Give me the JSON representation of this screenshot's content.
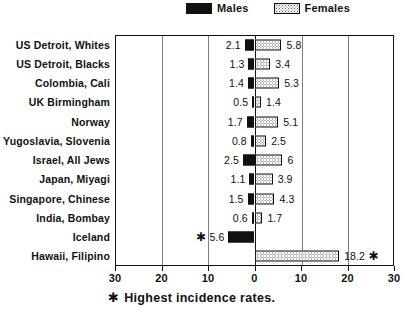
{
  "legend": {
    "males": {
      "label": "Males",
      "icon": "solid-black-swatch",
      "color": "#111111"
    },
    "females": {
      "label": "Females",
      "icon": "stippled-swatch",
      "color": "#ffffff"
    }
  },
  "footnote": {
    "star": "✱",
    "text": "Highest incidence rates."
  },
  "axis": {
    "ticks": [
      "30",
      "20",
      "10",
      "0",
      "10",
      "20",
      "30"
    ],
    "tick_units": [
      -30,
      -20,
      -10,
      0,
      10,
      20,
      30
    ]
  },
  "chart_data": {
    "type": "bar",
    "orientation": "horizontal",
    "layout": "diverging-bidirectional",
    "title": "",
    "subtitle": "",
    "xlabel": "",
    "ylabel": "",
    "xlim": [
      -30,
      30
    ],
    "grid": true,
    "gridlines_at": [
      -20,
      -10,
      10,
      20
    ],
    "legend_position": "top-center",
    "annotation": "✱ Highest incidence rates.",
    "categories": [
      "US Detroit, Whites",
      "US Detroit, Blacks",
      "Colombia, Cali",
      "UK Birmingham",
      "Norway",
      "Yugoslavia, Slovenia",
      "Israel, All Jews",
      "Japan, Miyagi",
      "Singapore, Chinese",
      "India, Bombay",
      "Iceland",
      "Hawaii, Filipino"
    ],
    "series": [
      {
        "name": "Males",
        "direction": "left",
        "color": "#111111",
        "values": [
          2.1,
          1.3,
          1.4,
          0.5,
          1.7,
          0.8,
          2.5,
          1.1,
          1.5,
          0.6,
          5.6,
          null
        ],
        "labels": [
          "2.1",
          "1.3",
          "1.4",
          "0.5",
          "1.7",
          "0.8",
          "2.5",
          "1.1",
          "1.5",
          "0.6",
          "5.6",
          ""
        ],
        "starred": [
          false,
          false,
          false,
          false,
          false,
          false,
          false,
          false,
          false,
          false,
          true,
          false
        ]
      },
      {
        "name": "Females",
        "direction": "right",
        "color": "#ffffff",
        "values": [
          5.8,
          3.4,
          5.3,
          1.4,
          5.1,
          2.5,
          6,
          3.9,
          4.3,
          1.7,
          null,
          18.2
        ],
        "labels": [
          "5.8",
          "3.4",
          "5.3",
          "1.4",
          "5.1",
          "2.5",
          "6",
          "3.9",
          "4.3",
          "1.7",
          "",
          "18.2"
        ],
        "starred": [
          false,
          false,
          false,
          false,
          false,
          false,
          false,
          false,
          false,
          false,
          false,
          true
        ]
      }
    ]
  }
}
